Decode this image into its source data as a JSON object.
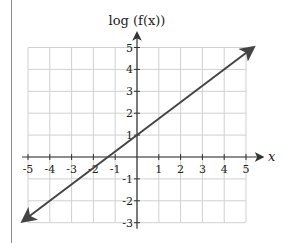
{
  "chart_data": {
    "type": "line",
    "title": "",
    "xlabel": "x",
    "ylabel": "log (f(x))",
    "xlim": [
      -5,
      5
    ],
    "ylim": [
      -3,
      5
    ],
    "grid": true,
    "x_ticks": [
      "-5",
      "-4",
      "-3",
      "-2",
      "-1",
      "1",
      "2",
      "3",
      "4",
      "5"
    ],
    "y_ticks": [
      "-3",
      "-2",
      "-1",
      "1",
      "2",
      "3",
      "4",
      "5"
    ],
    "series": [
      {
        "name": "log(f(x))",
        "slope": 0.75,
        "intercept": 1,
        "x": [
          -5.2,
          5.3
        ],
        "y": [
          -2.9,
          4.975
        ],
        "arrows_both_ends": true
      }
    ]
  },
  "colors": {
    "grid": "#d0d0d0",
    "axis": "#333333",
    "line": "#444444",
    "frame": "#8a8a8a"
  }
}
